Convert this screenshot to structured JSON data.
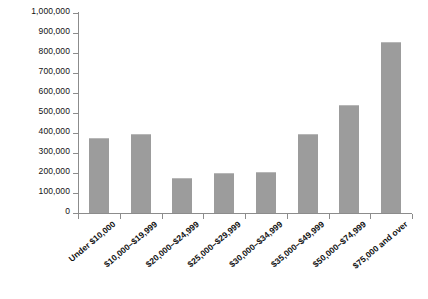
{
  "chart_data": {
    "type": "bar",
    "title": "",
    "xlabel": "",
    "ylabel": "",
    "grid": false,
    "legend": "none",
    "ylim": [
      0,
      1000000
    ],
    "ytick_step": 100000,
    "bar_color": "#9c9c9c",
    "axis_color": "#8c8c8c",
    "categories": [
      "Under $10,000",
      "$10,000–$19,999",
      "$20,000–$24,999",
      "$25,000–$29,999",
      "$30,000–$34,999",
      "$35,000–$49,999",
      "$50,000–$74,999",
      "$75,000 and over"
    ],
    "values": [
      375000,
      395000,
      175000,
      200000,
      205000,
      395000,
      540000,
      855000
    ],
    "ytick_labels": [
      "0",
      "100,000",
      "200,000",
      "300,000",
      "400,000",
      "500,000",
      "600,000",
      "700,000",
      "800,000",
      "900,000",
      "1,000,000"
    ],
    "ytick_values": [
      0,
      100000,
      200000,
      300000,
      400000,
      500000,
      600000,
      700000,
      800000,
      900000,
      1000000
    ]
  }
}
